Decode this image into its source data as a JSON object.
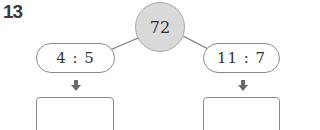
{
  "problem": {
    "number": "13",
    "total": "72",
    "ratios": [
      {
        "label": "4 : 5",
        "answer": ""
      },
      {
        "label": "11 : 7",
        "answer": ""
      }
    ]
  },
  "colors": {
    "circle_fill": "#d9d9d9",
    "border": "#8a8a8a",
    "arrow": "#6b6b6b"
  }
}
